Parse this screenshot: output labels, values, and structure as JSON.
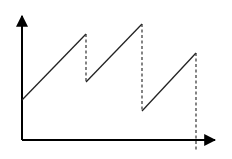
{
  "diagram": {
    "type": "sawtooth-line",
    "axes": {
      "origin": [
        22,
        140
      ],
      "y_axis_top": [
        22,
        16
      ],
      "x_axis_right": [
        215,
        140
      ],
      "color": "#000000"
    },
    "segments": [
      {
        "kind": "rise",
        "from": [
          22,
          100
        ],
        "to": [
          86,
          34
        ]
      },
      {
        "kind": "drop",
        "from": [
          86,
          34
        ],
        "to": [
          86,
          82
        ]
      },
      {
        "kind": "rise",
        "from": [
          86,
          82
        ],
        "to": [
          142,
          24
        ]
      },
      {
        "kind": "drop",
        "from": [
          142,
          24
        ],
        "to": [
          142,
          111
        ]
      },
      {
        "kind": "rise",
        "from": [
          142,
          111
        ],
        "to": [
          196,
          53
        ]
      },
      {
        "kind": "drop",
        "from": [
          196,
          53
        ],
        "to": [
          196,
          150
        ]
      }
    ],
    "line_color": "#222222",
    "dash_color": "#333333"
  }
}
